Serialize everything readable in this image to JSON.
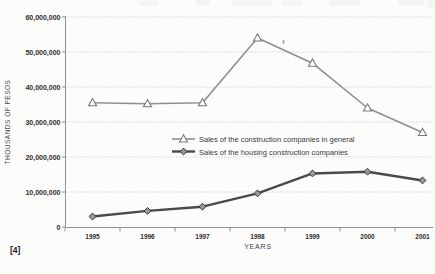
{
  "page": {
    "background": "#fcfcfb",
    "footnote": "[4]"
  },
  "chart_data": {
    "type": "line",
    "title": "",
    "xlabel": "YEARS",
    "ylabel": "THOUSANDS OF PESOS",
    "categories": [
      "1995",
      "1996",
      "1997",
      "1998",
      "1999",
      "2000",
      "2001"
    ],
    "series": [
      {
        "name": "Sales of the construction companies in general",
        "marker": "triangle",
        "color": "#8f8f8f",
        "marker_fill": "#ffffff",
        "marker_stroke": "#787878",
        "line_width": 1.6,
        "values": [
          35500000,
          35200000,
          35500000,
          54000000,
          46800000,
          34000000,
          27000000
        ]
      },
      {
        "name": "Sales of the housing construction companies",
        "marker": "diamond",
        "color": "#4a4a4a",
        "marker_fill": "#999999",
        "marker_stroke": "#333333",
        "line_width": 2.4,
        "values": [
          3000000,
          4600000,
          5800000,
          9600000,
          15300000,
          15800000,
          13300000
        ]
      }
    ],
    "ylim": [
      0,
      60000000
    ],
    "ytick_step": 10000000,
    "ytick_labels": [
      "0",
      "10,000,000",
      "20,000,000",
      "30,000,000",
      "40,000,000",
      "50,000,000",
      "60,000,000"
    ],
    "grid": "horizontal-dotted",
    "legend_position": "inside-center-right"
  }
}
